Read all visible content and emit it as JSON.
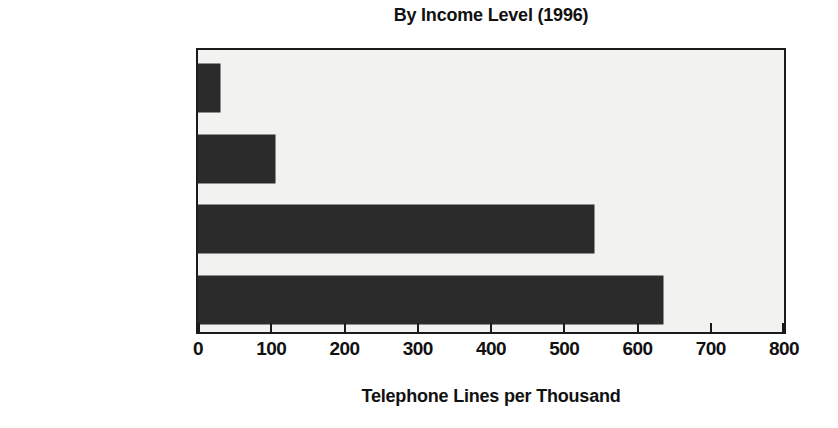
{
  "chart_data": {
    "type": "bar",
    "orientation": "horizontal",
    "title": "By Income Level (1996)",
    "xlabel": "Telephone Lines per Thousand",
    "ylabel": "",
    "categories": [
      "Low Income",
      "Middle Income",
      "High Income",
      "United States"
    ],
    "values": [
      30,
      105,
      540,
      635
    ],
    "xlim": [
      0,
      800
    ],
    "xticks": [
      0,
      100,
      200,
      300,
      400,
      500,
      600,
      700,
      800
    ],
    "xtick_labels": [
      "0",
      "100",
      "200",
      "300",
      "400",
      "500",
      "600",
      "700",
      "800"
    ],
    "grid": false,
    "legend": false,
    "bar_color": "#2b2b2b",
    "plot_background": "#f2f2f0",
    "frame_color": "#1a1a1a"
  }
}
